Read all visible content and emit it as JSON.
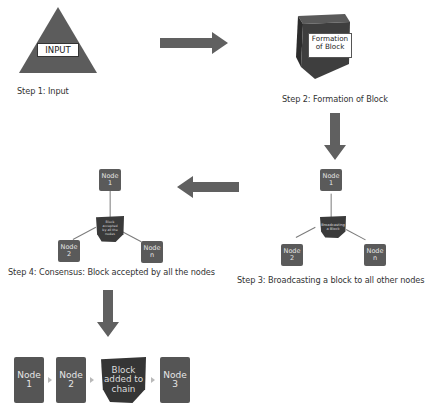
{
  "diagram": {
    "colors": {
      "shape_dark": "#3a3a3a",
      "node_fill": "#5a5a5a",
      "arrow_fill": "#606060",
      "triangle_fill": "#5c5c5c",
      "connector": "#7b7b7b"
    },
    "steps": [
      {
        "id": "step1",
        "caption": "Step 1: Input",
        "shape": "triangle",
        "label": "INPUT"
      },
      {
        "id": "step2",
        "caption": "Step 2: Formation of Block",
        "shape": "cube",
        "label_line1": "Formation",
        "label_line2": "of Block"
      },
      {
        "id": "step3",
        "caption": "Step 3: Broadcasting a block to all other nodes",
        "center_label_line1": "Broadcasting",
        "center_label_line2": "a Block",
        "nodes": [
          {
            "line1": "Node",
            "line2": "1"
          },
          {
            "line1": "Node",
            "line2": "2"
          },
          {
            "line1": "Node",
            "line2": "n"
          }
        ]
      },
      {
        "id": "step4",
        "caption": "Step 4: Consensus: Block accepted by all the nodes",
        "center_label_lines": [
          "Block",
          "accepted",
          "by all the",
          "nodes"
        ],
        "nodes": [
          {
            "line1": "Node",
            "line2": "1"
          },
          {
            "line1": "Node",
            "line2": "2"
          },
          {
            "line1": "Node",
            "line2": "n"
          }
        ]
      },
      {
        "id": "step5",
        "chain": [
          {
            "type": "node",
            "line1": "Node",
            "line2": "1"
          },
          {
            "type": "node",
            "line1": "Node",
            "line2": "2"
          },
          {
            "type": "block",
            "lines": [
              "Block",
              "added to",
              "chain"
            ]
          },
          {
            "type": "node",
            "line1": "Node",
            "line2": "3"
          }
        ]
      }
    ],
    "arrows": [
      {
        "from": "step1",
        "to": "step2",
        "direction": "right"
      },
      {
        "from": "step2",
        "to": "step3",
        "direction": "down"
      },
      {
        "from": "step3",
        "to": "step4",
        "direction": "left"
      },
      {
        "from": "step4",
        "to": "step5",
        "direction": "down"
      }
    ]
  }
}
